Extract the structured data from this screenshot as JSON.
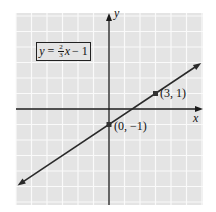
{
  "chart_data": {
    "type": "line",
    "title": "",
    "equation": {
      "lhs": "y",
      "eq": "=",
      "slope_num": "2",
      "slope_den": "3",
      "var": "x",
      "rest": "− 1"
    },
    "xlabel": "x",
    "ylabel": "y",
    "xlim": [
      -6,
      6
    ],
    "ylim": [
      -6,
      6
    ],
    "grid": true,
    "series": [
      {
        "name": "y = 2/3 x − 1",
        "slope": 0.6667,
        "intercept": -1,
        "x": [
          -5.9,
          5.95
        ],
        "y": [
          -4.93,
          2.97
        ]
      }
    ],
    "points": [
      {
        "x": 0,
        "y": -1,
        "label": "(0, −1)"
      },
      {
        "x": 3,
        "y": 1,
        "label": "(3, 1)"
      }
    ]
  },
  "colors": {
    "grid_bg": "#e4e4e4",
    "grid_line": "#fafafa",
    "axis": "#1a1a1a",
    "line": "#2a2a2a",
    "point": "#333333"
  }
}
